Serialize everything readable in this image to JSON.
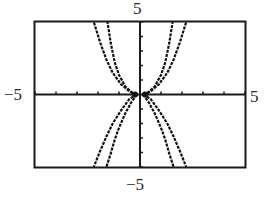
{
  "chart_data": {
    "type": "line",
    "title": "",
    "xlabel": "",
    "ylabel": "",
    "xlim": [
      -5,
      5
    ],
    "ylim": [
      -5,
      5
    ],
    "xticks_step": 1,
    "yticks_step": 1,
    "grid": false,
    "legend": null,
    "axis_labels": {
      "top": "5",
      "bottom": "−5",
      "left": "−5",
      "right": "5"
    },
    "series": [
      {
        "name": "upper-inner",
        "points": [
          [
            0.15,
            0
          ],
          [
            0.4,
            0.15
          ],
          [
            0.7,
            0.55
          ],
          [
            1.0,
            1.35
          ],
          [
            1.2,
            2.2
          ],
          [
            1.4,
            3.6
          ],
          [
            1.55,
            5.0
          ]
        ]
      },
      {
        "name": "upper-outer",
        "points": [
          [
            0.15,
            0
          ],
          [
            0.5,
            0.2
          ],
          [
            0.9,
            0.7
          ],
          [
            1.3,
            1.5
          ],
          [
            1.6,
            2.4
          ],
          [
            1.9,
            3.6
          ],
          [
            2.2,
            5.0
          ]
        ]
      },
      {
        "name": "lower-inner",
        "points": [
          [
            0.15,
            0
          ],
          [
            0.4,
            -0.5
          ],
          [
            0.7,
            -1.3
          ],
          [
            1.0,
            -2.3
          ],
          [
            1.2,
            -3.1
          ],
          [
            1.4,
            -4.1
          ],
          [
            1.6,
            -5.0
          ]
        ]
      },
      {
        "name": "lower-outer",
        "points": [
          [
            0.15,
            0
          ],
          [
            0.5,
            -0.3
          ],
          [
            0.9,
            -1.1
          ],
          [
            1.3,
            -2.0
          ],
          [
            1.6,
            -2.9
          ],
          [
            1.9,
            -3.9
          ],
          [
            2.2,
            -5.0
          ]
        ]
      }
    ],
    "symmetry": "each series mirrored about the y-axis (x -> -x)"
  },
  "colors": {
    "frame": "#1a1a1a",
    "axis": "#1a1a1a",
    "curve": "#111111",
    "text": "#2a2a2a",
    "background": "#ffffff"
  }
}
